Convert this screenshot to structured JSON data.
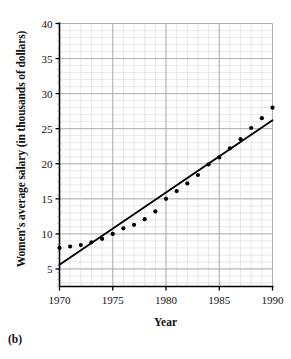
{
  "figure": {
    "panel_label": "(b)",
    "xlabel": "Year",
    "ylabel": "Women's average salary (in thousands of dollars)"
  },
  "chart_data": {
    "type": "scatter",
    "title": "",
    "xlabel": "Year",
    "ylabel": "Women's average salary (in thousands of dollars)",
    "xlim": [
      1970,
      1990
    ],
    "ylim": [
      2.5,
      40
    ],
    "xticks": [
      1970,
      1975,
      1980,
      1985,
      1990
    ],
    "yticks": [
      5,
      10,
      15,
      20,
      25,
      30,
      35,
      40
    ],
    "xtick_labels": [
      "1970",
      "1975",
      "1980",
      "1985",
      "1990"
    ],
    "ytick_labels": [
      "5",
      "10",
      "15",
      "20",
      "25",
      "30",
      "35",
      "40"
    ],
    "grid": true,
    "minor_grid": true,
    "minor_grid_divisions": 5,
    "legend": "none",
    "x": [
      1970,
      1971,
      1972,
      1973,
      1974,
      1975,
      1976,
      1977,
      1978,
      1979,
      1980,
      1981,
      1982,
      1983,
      1984,
      1985,
      1986,
      1987,
      1988,
      1989,
      1990
    ],
    "values": [
      8.0,
      8.2,
      8.4,
      8.8,
      9.3,
      10.0,
      10.8,
      11.3,
      12.1,
      13.2,
      15.0,
      16.1,
      17.2,
      18.4,
      19.9,
      20.9,
      22.2,
      23.5,
      25.1,
      26.5,
      28.0
    ],
    "series": [
      {
        "name": "Women's average salary",
        "type": "scatter",
        "marker": "filled-circle",
        "color": "#000000",
        "values": [
          8.0,
          8.2,
          8.4,
          8.8,
          9.3,
          10.0,
          10.8,
          11.3,
          12.1,
          13.2,
          15.0,
          16.1,
          17.2,
          18.4,
          19.9,
          20.9,
          22.2,
          23.5,
          25.1,
          26.5,
          28.0
        ]
      },
      {
        "name": "Regression line",
        "type": "line",
        "color": "#000000",
        "endpoints": [
          {
            "x": 1970,
            "y": 5.6
          },
          {
            "x": 1990,
            "y": 26.2
          }
        ]
      }
    ]
  },
  "axis_colors": {
    "axis": "#000000",
    "major_grid": "#a8a8b4",
    "minor_grid": "#d8d8e0",
    "data": "#000000"
  }
}
